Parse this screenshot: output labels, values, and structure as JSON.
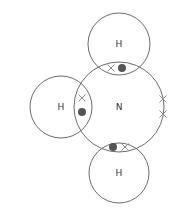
{
  "diagram": {
    "type": "dot-and-cross",
    "molecule": "NH3",
    "colors": {
      "shell": "#6b6b6b",
      "label": "#333333",
      "cross": "#8a8a8a",
      "dot": "#555555",
      "background": "#ffffff"
    },
    "atoms": [
      {
        "id": "N",
        "label": "N",
        "cx": 119,
        "cy": 107,
        "r": 45
      },
      {
        "id": "H-top",
        "label": "H",
        "cx": 119,
        "cy": 44,
        "r": 31
      },
      {
        "id": "H-left",
        "label": "H",
        "cx": 61,
        "cy": 107,
        "r": 31
      },
      {
        "id": "H-bottom",
        "label": "H",
        "cx": 119,
        "cy": 173,
        "r": 30
      }
    ],
    "electrons": {
      "crosses": [
        {
          "owner": "N",
          "bond": "N-H-top",
          "x": 111,
          "y": 68
        },
        {
          "owner": "N",
          "bond": "N-H-left",
          "x": 82,
          "y": 98
        },
        {
          "owner": "N",
          "bond": "N-H-bottom",
          "x": 125,
          "y": 147
        },
        {
          "owner": "N",
          "lone_pair": true,
          "x": 163,
          "y": 99
        },
        {
          "owner": "N",
          "lone_pair": true,
          "x": 163,
          "y": 114
        }
      ],
      "dots": [
        {
          "owner": "H-top",
          "x": 122,
          "y": 68
        },
        {
          "owner": "H-left",
          "x": 82,
          "y": 112
        },
        {
          "owner": "H-bottom",
          "x": 113,
          "y": 147
        }
      ]
    }
  }
}
